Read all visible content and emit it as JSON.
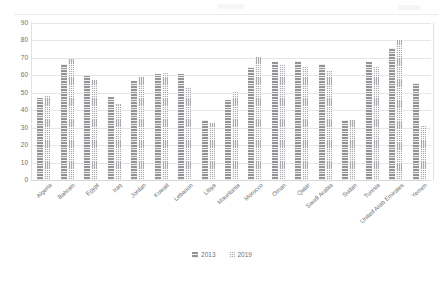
{
  "chart_data": {
    "type": "bar",
    "title": "",
    "subtitle": "",
    "xlabel": "",
    "ylabel": "",
    "ylim": [
      0,
      90
    ],
    "ytick_step": 10,
    "yticks": [
      90,
      80,
      70,
      60,
      50,
      40,
      30,
      20,
      10,
      0
    ],
    "grid": true,
    "legend_position": "bottom",
    "categories": [
      "Algeria",
      "Bahrain",
      "Egypt",
      "Iraq",
      "Jordan",
      "Kuwait",
      "Lebanon",
      "Libya",
      "Mauritania",
      "Morocco",
      "Oman",
      "Qatar",
      "Saudi Arabia",
      "Sudan",
      "Tunisia",
      "United Arab Emirates",
      "Yemen"
    ],
    "series": [
      {
        "name": "2013",
        "pattern": "horizontal-lines",
        "color": "#939398",
        "values": [
          47,
          66.5,
          59.5,
          47.5,
          56.5,
          60.5,
          60.5,
          34.5,
          46,
          64.5,
          67.5,
          68.5,
          66.5,
          34.5,
          67.5,
          75.5,
          55.5
        ]
      },
      {
        "name": "2019",
        "pattern": "dotted-grid",
        "color": "#a9a9ae",
        "values": [
          48.5,
          69.5,
          57.5,
          43.5,
          59.5,
          61.5,
          53.5,
          32.5,
          50.5,
          70.5,
          66.5,
          64.5,
          62.5,
          34.5,
          65.5,
          80.5,
          31
        ]
      }
    ]
  },
  "legend": {
    "items": [
      {
        "label": "2013",
        "key": "s2013"
      },
      {
        "label": "2019",
        "key": "s2019"
      }
    ]
  }
}
